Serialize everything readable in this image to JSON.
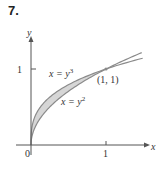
{
  "problem_number": "7.",
  "chart_data": {
    "type": "area",
    "title": "",
    "xlabel": "x",
    "ylabel": "y",
    "xlim": [
      0,
      1.5
    ],
    "ylim": [
      0,
      1.5
    ],
    "grid": false,
    "x_ticks": [
      "0",
      "1"
    ],
    "y_ticks": [
      "1"
    ],
    "series": [
      {
        "name": "x = y^3",
        "equation": "x = y^3",
        "label_text": "x = y",
        "label_sup": "3"
      },
      {
        "name": "x = y^2",
        "equation": "x = y^2",
        "label_text": "x = y",
        "label_sup": "2"
      }
    ],
    "shaded_region": "between x = y^3 and x = y^2 for 0 ≤ y ≤ 1",
    "shade_color": "#d6d6d6",
    "curve_color": "#8a8a8a",
    "annotations": [
      {
        "text": "(1, 1)",
        "x": 1,
        "y": 1
      }
    ]
  }
}
